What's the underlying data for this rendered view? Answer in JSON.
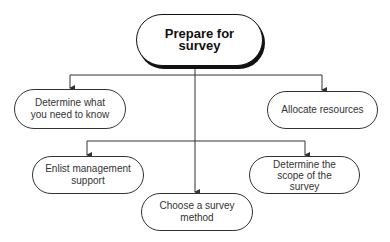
{
  "diagram": {
    "type": "flowchart",
    "root": {
      "id": "prepare",
      "label": "Prepare for survey"
    },
    "nodes": [
      {
        "id": "need_to_know",
        "label": "Determine what\nyou need to know"
      },
      {
        "id": "allocate",
        "label": "Allocate resources"
      },
      {
        "id": "enlist",
        "label": "Enlist management\nsupport"
      },
      {
        "id": "scope",
        "label": "Determine the\nscope of the\nsurvey"
      },
      {
        "id": "method",
        "label": "Choose a survey\nmethod"
      }
    ],
    "edges": [
      {
        "from": "prepare",
        "to": "need_to_know"
      },
      {
        "from": "prepare",
        "to": "allocate"
      },
      {
        "from": "prepare",
        "to": "enlist"
      },
      {
        "from": "prepare",
        "to": "scope"
      },
      {
        "from": "prepare",
        "to": "method"
      }
    ],
    "colors": {
      "line": "#333333",
      "fill": "#ffffff",
      "text": "#333333"
    }
  }
}
